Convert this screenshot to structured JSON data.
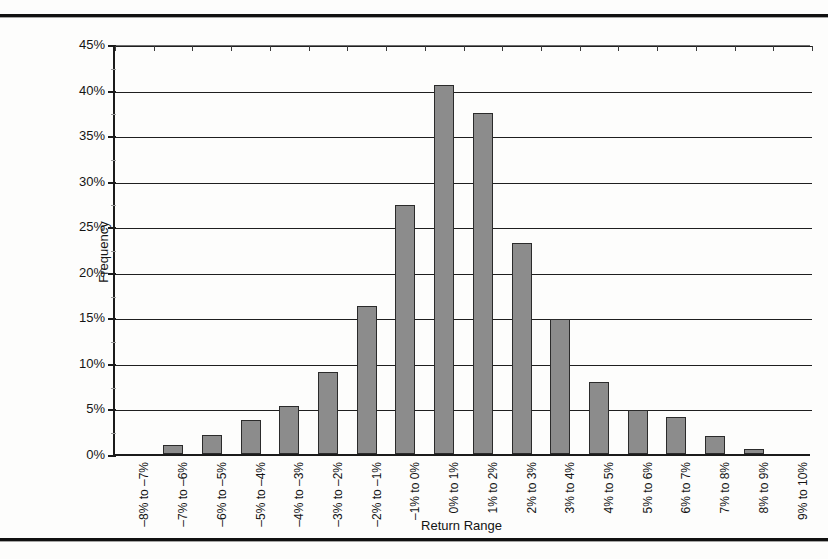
{
  "page": {
    "title_fragment": "Frequency Distribution of Daily Returns",
    "rules": {
      "top": "top-rule",
      "bottom": "bottom-rule"
    }
  },
  "chart_data": {
    "type": "bar",
    "title": "Frequency Distribution of Daily Returns",
    "xlabel": "Return Range",
    "ylabel": "Frequency",
    "ylim": [
      0,
      45
    ],
    "grid": true,
    "legend": "none",
    "ytick_labels": [
      "0%",
      "5%",
      "10%",
      "15%",
      "20%",
      "25%",
      "30%",
      "35%",
      "40%",
      "45%"
    ],
    "ytick_values": [
      0,
      5,
      10,
      15,
      20,
      25,
      30,
      35,
      40,
      45
    ],
    "categories": [
      "–8% to –7%",
      "–7% to –6%",
      "–6% to –5%",
      "–5% to –4%",
      "–4% to –3%",
      "–3% to –2%",
      "–2% to –1%",
      "–1% to 0%",
      "0% to 1%",
      "1% to 2%",
      "2% to 3%",
      "3% to 4%",
      "4% to 5%",
      "5% to 6%",
      "6% to 7%",
      "7% to 8%",
      "8% to 9%",
      "9% to 10%"
    ],
    "values": [
      0.0,
      1.0,
      2.1,
      3.7,
      5.3,
      9.0,
      16.3,
      27.3,
      40.5,
      37.4,
      23.2,
      14.8,
      7.9,
      4.8,
      4.1,
      2.0,
      0.5,
      0.0
    ],
    "value_labels": [
      "0%",
      "1.0%",
      "2.1%",
      "3.7%",
      "5.3%",
      "9.0%",
      "16.3%",
      "27.3%",
      "40.5%",
      "37.4%",
      "23.2%",
      "14.8%",
      "7.9%",
      "4.8%",
      "4.1%",
      "2.0%",
      "0.5%",
      "0%"
    ],
    "colors": {
      "bar_fill": "#8c8c8c",
      "bar_stroke": "#2b2b2b",
      "grid": "#1f1f1f",
      "axis": "#1b1b1b"
    }
  }
}
